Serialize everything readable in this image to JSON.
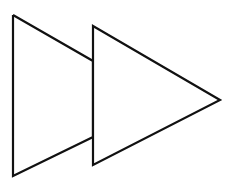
{
  "icon": {
    "semantic": "fast-forward-icon",
    "stroke_color": "#111111",
    "fill_color": "#ffffff",
    "stroke_width": 2.2,
    "back_triangle": {
      "points": "13,15 93,61 93,137 13,176"
    },
    "front_triangle": {
      "points": "93,26 220,100 93,165"
    }
  }
}
